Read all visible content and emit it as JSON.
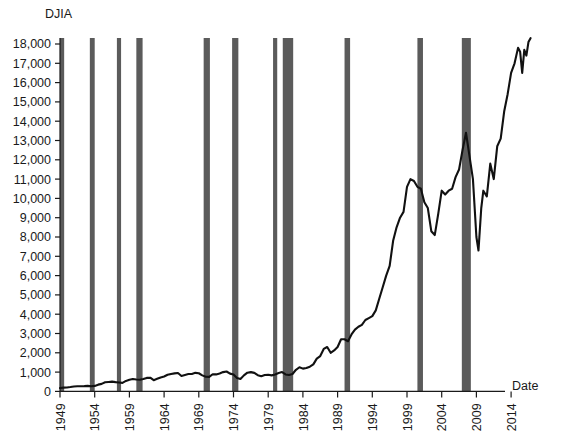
{
  "chart_data": {
    "type": "line",
    "title": "",
    "ylabel": "DJIA",
    "xlabel": "Date",
    "grid": false,
    "legend": "none",
    "ylim": [
      0,
      18000
    ],
    "xlim": [
      1949,
      2017
    ],
    "ytick_labels": [
      "18,000",
      "17,000",
      "16,000",
      "15,000",
      "14,000",
      "13,000",
      "12,000",
      "11,000",
      "10,000",
      "9,000",
      "8,000",
      "7,000",
      "6,000",
      "5,000",
      "4,000",
      "3,000",
      "2,000",
      "1,000",
      "0"
    ],
    "ytick_values": [
      18000,
      17000,
      16000,
      15000,
      14000,
      13000,
      12000,
      11000,
      10000,
      9000,
      8000,
      7000,
      6000,
      5000,
      4000,
      3000,
      2000,
      1000,
      0
    ],
    "xtick_labels": [
      "1949",
      "1954",
      "1959",
      "1964",
      "1969",
      "1974",
      "1979",
      "1984",
      "1989",
      "1994",
      "1999",
      "2004",
      "2009",
      "2014"
    ],
    "xtick_values": [
      1949,
      1954,
      1959,
      1964,
      1969,
      1974,
      1979,
      1984,
      1989,
      1994,
      1999,
      2004,
      2009,
      2014
    ],
    "series": [
      {
        "name": "DJIA",
        "color": "#111111",
        "x": [
          1949.0,
          1949.5,
          1950.0,
          1950.5,
          1951.0,
          1951.5,
          1952.0,
          1952.5,
          1953.0,
          1953.5,
          1954.0,
          1954.5,
          1955.0,
          1955.5,
          1956.0,
          1956.5,
          1957.0,
          1957.5,
          1958.0,
          1958.5,
          1959.0,
          1959.5,
          1960.0,
          1960.5,
          1961.0,
          1961.5,
          1962.0,
          1962.5,
          1963.0,
          1963.5,
          1964.0,
          1964.5,
          1965.0,
          1965.5,
          1966.0,
          1966.5,
          1967.0,
          1967.5,
          1968.0,
          1968.5,
          1969.0,
          1969.5,
          1970.0,
          1970.5,
          1971.0,
          1971.5,
          1972.0,
          1972.5,
          1973.0,
          1973.5,
          1974.0,
          1974.5,
          1975.0,
          1975.5,
          1976.0,
          1976.5,
          1977.0,
          1977.5,
          1978.0,
          1978.5,
          1979.0,
          1979.5,
          1980.0,
          1980.5,
          1981.0,
          1981.5,
          1982.0,
          1982.5,
          1983.0,
          1983.5,
          1984.0,
          1984.5,
          1985.0,
          1985.5,
          1986.0,
          1986.5,
          1987.0,
          1987.5,
          1988.0,
          1988.5,
          1989.0,
          1989.5,
          1990.0,
          1990.5,
          1991.0,
          1991.5,
          1992.0,
          1992.5,
          1993.0,
          1993.5,
          1994.0,
          1994.5,
          1995.0,
          1995.5,
          1996.0,
          1996.5,
          1997.0,
          1997.5,
          1998.0,
          1998.5,
          1999.0,
          1999.5,
          2000.0,
          2000.5,
          2001.0,
          2001.5,
          2002.0,
          2002.5,
          2003.0,
          2003.5,
          2004.0,
          2004.5,
          2005.0,
          2005.5,
          2006.0,
          2006.5,
          2007.0,
          2007.5,
          2008.0,
          2008.5,
          2009.0,
          2009.3,
          2009.7,
          2010.0,
          2010.5,
          2011.0,
          2011.5,
          2012.0,
          2012.5,
          2013.0,
          2013.5,
          2014.0,
          2014.5,
          2015.0,
          2015.3,
          2015.6,
          2015.9,
          2016.2,
          2016.5,
          2016.8
        ],
        "y": [
          175,
          195,
          205,
          225,
          250,
          265,
          270,
          275,
          285,
          265,
          285,
          350,
          390,
          470,
          490,
          505,
          480,
          460,
          440,
          545,
          600,
          645,
          620,
          600,
          640,
          700,
          710,
          580,
          650,
          720,
          770,
          860,
          905,
          935,
          950,
          800,
          850,
          900,
          900,
          960,
          940,
          830,
          760,
          750,
          890,
          880,
          930,
          1000,
          1030,
          920,
          880,
          700,
          640,
          830,
          970,
          1000,
          960,
          840,
          790,
          850,
          860,
          830,
          880,
          950,
          1000,
          880,
          850,
          900,
          1120,
          1250,
          1180,
          1210,
          1280,
          1400,
          1700,
          1830,
          2200,
          2300,
          2000,
          2120,
          2300,
          2700,
          2700,
          2600,
          2950,
          3200,
          3350,
          3450,
          3700,
          3800,
          3900,
          4200,
          4800,
          5400,
          6000,
          6500,
          7800,
          8500,
          9000,
          9300,
          10600,
          11000,
          10900,
          10600,
          10500,
          9800,
          9500,
          8300,
          8100,
          9200,
          10400,
          10200,
          10400,
          10500,
          11100,
          11500,
          12500,
          13400,
          12200,
          11000,
          8000,
          7300,
          9500,
          10400,
          10100,
          11800,
          11000,
          12700,
          13100,
          14500,
          15400,
          16500,
          17000,
          17800,
          17600,
          16500,
          17700,
          17400,
          18100,
          18300
        ]
      }
    ],
    "annotations": {
      "shaded_bands_meaning": "recession",
      "band_color": "#5b5b5b",
      "bands": [
        {
          "start": 1949.0,
          "end": 1949.6
        },
        {
          "start": 1953.3,
          "end": 1954.0
        },
        {
          "start": 1957.2,
          "end": 1957.8
        },
        {
          "start": 1960.0,
          "end": 1960.9
        },
        {
          "start": 1969.7,
          "end": 1970.6
        },
        {
          "start": 1973.8,
          "end": 1974.7
        },
        {
          "start": 1979.7,
          "end": 1980.3
        },
        {
          "start": 1981.1,
          "end": 1982.6
        },
        {
          "start": 1990.0,
          "end": 1990.8
        },
        {
          "start": 2000.5,
          "end": 2001.3
        },
        {
          "start": 2006.9,
          "end": 2008.2
        }
      ]
    }
  }
}
